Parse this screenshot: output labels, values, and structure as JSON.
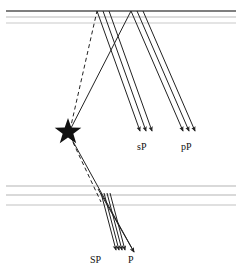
{
  "figure": {
    "type": "seismic-ray-path-diagram",
    "background_color": "#ffffff",
    "width": 242,
    "height": 274
  },
  "layers": {
    "surface_group_label": "free-surface-lines",
    "surface_lines": [
      {
        "name": "free-surface",
        "y": 11,
        "x1": 6,
        "x2": 236,
        "color": "#555555",
        "width": 1.6
      },
      {
        "name": "near-surface-layer-1",
        "y": 17,
        "x1": 6,
        "x2": 236,
        "color": "#b9b9b9",
        "width": 1.2
      },
      {
        "name": "near-surface-layer-2",
        "y": 23,
        "x1": 6,
        "x2": 236,
        "color": "#c9c9c9",
        "width": 1.2
      }
    ],
    "deep_group_label": "deep-interface-lines",
    "deep_lines": [
      {
        "name": "deep-interface-1",
        "y": 186,
        "x1": 6,
        "x2": 236,
        "color": "#b4b4b4",
        "width": 1.2
      },
      {
        "name": "deep-interface-2",
        "y": 195,
        "x1": 6,
        "x2": 236,
        "color": "#b4b4b4",
        "width": 1.2
      },
      {
        "name": "deep-interface-3",
        "y": 205,
        "x1": 6,
        "x2": 236,
        "color": "#c2c2c2",
        "width": 1.2
      }
    ]
  },
  "source": {
    "name": "earthquake-hypocenter-star",
    "x": 68,
    "y": 132,
    "outer_radius": 14,
    "inner_radius": 5.6,
    "color": "#111111"
  },
  "ray_color": "#222222",
  "ray_width": 1.0,
  "rays": {
    "upgoing_to_surface": [
      {
        "name": "upgoing-s-leg",
        "style": "dashed",
        "x1": 70,
        "y1": 130,
        "x2": 97,
        "y2": 11
      },
      {
        "name": "upgoing-p-leg",
        "style": "solid",
        "x1": 70,
        "y1": 130,
        "x2": 131,
        "y2": 11
      }
    ],
    "downgoing_from_source": [
      {
        "name": "downgoing-s-leg",
        "style": "dashed",
        "x1": 70,
        "y1": 136,
        "x2": 101,
        "y2": 202
      },
      {
        "name": "downgoing-p-leg",
        "style": "solid",
        "x1": 70,
        "y1": 136,
        "x2": 134,
        "y2": 252
      }
    ],
    "bundles": [
      {
        "name": "sp-reflected-bundle",
        "label": "sP",
        "reflection_x": 97,
        "reflection_y": 11,
        "count": 3,
        "offsets": [
          0,
          6,
          12
        ],
        "end_x": 140,
        "end_y": 131,
        "arrowheads": true
      },
      {
        "name": "pp-reflected-bundle",
        "label": "pP",
        "reflection_x": 131,
        "reflection_y": 11,
        "count": 3,
        "offsets": [
          0,
          6,
          12
        ],
        "end_x": 183,
        "end_y": 131,
        "arrowheads": true
      },
      {
        "name": "sp-depth-bundle",
        "label": "SP",
        "start_x": 101,
        "start_y": 193,
        "count": 4,
        "offsets": [
          0,
          3,
          6,
          9
        ],
        "end_x": 116,
        "end_y": 250,
        "arrowheads": true
      },
      {
        "name": "p-direct-ray",
        "label": "P",
        "start_x": 98,
        "start_y": 189,
        "count": 1,
        "offsets": [
          0
        ],
        "end_x": 134,
        "end_y": 252,
        "arrowheads": true
      }
    ]
  },
  "labels": [
    {
      "name": "label-sP",
      "text": "sP",
      "x": 137,
      "y": 150,
      "anchor": "start"
    },
    {
      "name": "label-pP",
      "text": "pP",
      "x": 181,
      "y": 150,
      "anchor": "start"
    },
    {
      "name": "label-SP",
      "text": "SP",
      "x": 90,
      "y": 263,
      "anchor": "start"
    },
    {
      "name": "label-P",
      "text": "P",
      "x": 128,
      "y": 263,
      "anchor": "start"
    }
  ]
}
